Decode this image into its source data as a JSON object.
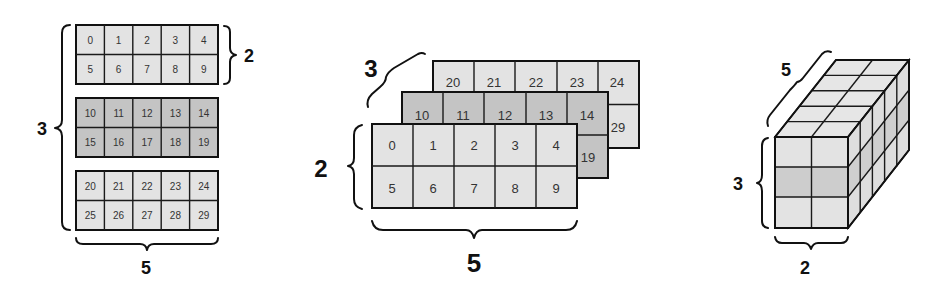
{
  "diagram": {
    "colors": {
      "cell_light": "#e3e3e3",
      "cell_mid": "#d2d2d2",
      "cell_dark": "#c4c4c4",
      "line": "#1a1a1a",
      "background": "#ffffff"
    },
    "left_panel": {
      "slices": [
        {
          "name": "slice-0",
          "values": [
            [
              0,
              1,
              2,
              3,
              4
            ],
            [
              5,
              6,
              7,
              8,
              9
            ]
          ]
        },
        {
          "name": "slice-1",
          "values": [
            [
              10,
              11,
              12,
              13,
              14
            ],
            [
              15,
              16,
              17,
              18,
              19
            ]
          ]
        },
        {
          "name": "slice-2",
          "values": [
            [
              20,
              21,
              22,
              23,
              24
            ],
            [
              25,
              26,
              27,
              28,
              29
            ]
          ]
        }
      ],
      "labels": {
        "rows": "2",
        "slices": "3",
        "cols": "5"
      }
    },
    "middle_panel": {
      "layers": [
        {
          "name": "back-layer",
          "visible_values": [
            "20",
            "21",
            "22",
            "23",
            "24",
            "29"
          ]
        },
        {
          "name": "middle-layer",
          "visible_values": [
            "10",
            "11",
            "12",
            "13",
            "14",
            "19"
          ]
        },
        {
          "name": "front-layer",
          "values": [
            [
              0,
              1,
              2,
              3,
              4
            ],
            [
              5,
              6,
              7,
              8,
              9
            ]
          ]
        }
      ],
      "labels": {
        "depth": "3",
        "rows": "2",
        "cols": "5"
      }
    },
    "right_panel": {
      "shape": "3D block",
      "labels": {
        "depth": "5",
        "height": "3",
        "width": "2"
      }
    }
  }
}
